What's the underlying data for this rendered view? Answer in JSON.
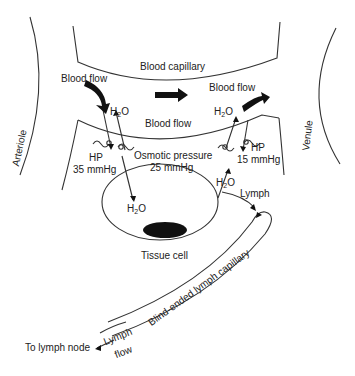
{
  "diagram": {
    "type": "physiology-schematic",
    "labels": {
      "blood_capillary": "Blood capillary",
      "blood_flow_left": "Blood flow",
      "blood_flow_center": "Blood flow",
      "blood_flow_right": "Blood flow",
      "arteriole": "Arteriole",
      "venule": "Venule",
      "h2o_top_left": {
        "main": "H",
        "sub": "2",
        "tail": "O"
      },
      "h2o_top_right": {
        "main": "H",
        "sub": "2",
        "tail": "O"
      },
      "h2o_cell": {
        "main": "H",
        "sub": "2",
        "tail": "O"
      },
      "h2o_lymph": {
        "main": "H",
        "sub": "2",
        "tail": "O"
      },
      "hp_left": "HP",
      "hp_left_value": "35 mmHg",
      "hp_right": "HP",
      "hp_right_value": "15 mmHg",
      "osmotic_pressure": "Osmotic pressure",
      "osmotic_value": "25 mmHg",
      "lymph": "Lymph",
      "tissue_cell": "Tissue cell",
      "lymph_capillary": "Blind-ended lymph capillary",
      "lymph_flow_1": "Lymph",
      "lymph_flow_2": "flow",
      "to_lymph_node": "To lymph node"
    },
    "colors": {
      "line": "#333333",
      "fill": "#111111",
      "background": "#ffffff"
    }
  }
}
